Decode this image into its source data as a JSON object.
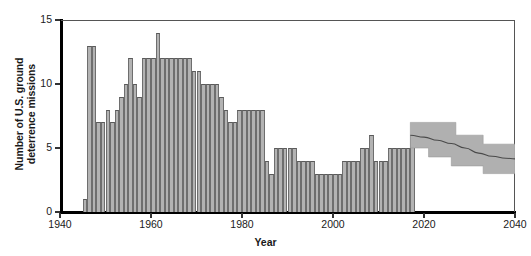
{
  "chart_data": {
    "type": "bar",
    "title": "",
    "xlabel": "Year",
    "ylabel": "Number of U.S. ground\ndeterrence missions",
    "xlim": [
      1940,
      2040
    ],
    "ylim": [
      0,
      15
    ],
    "grid": false,
    "legend": null,
    "xticks": [
      1940,
      1960,
      1980,
      2000,
      2020,
      2040
    ],
    "yticks": [
      0,
      5,
      10,
      15
    ],
    "bar_color": "#b3b3b3",
    "bar_edge_color": "#5a5a5a",
    "band_color": "#b0b0b0",
    "median_color": "#4a4a4a",
    "x": [
      1945,
      1946,
      1947,
      1948,
      1949,
      1950,
      1951,
      1952,
      1953,
      1954,
      1955,
      1956,
      1957,
      1958,
      1959,
      1960,
      1961,
      1962,
      1963,
      1964,
      1965,
      1966,
      1967,
      1968,
      1969,
      1970,
      1971,
      1972,
      1973,
      1974,
      1975,
      1976,
      1977,
      1978,
      1979,
      1980,
      1981,
      1982,
      1983,
      1984,
      1985,
      1986,
      1987,
      1988,
      1989,
      1990,
      1991,
      1992,
      1993,
      1994,
      1995,
      1996,
      1997,
      1998,
      1999,
      2000,
      2001,
      2002,
      2003,
      2004,
      2005,
      2006,
      2007,
      2008,
      2009,
      2010,
      2011,
      2012,
      2013,
      2014,
      2015,
      2016,
      2017
    ],
    "values": [
      1,
      13,
      13,
      7,
      7,
      8,
      7,
      8,
      9,
      10,
      12,
      10,
      9,
      12,
      12,
      12,
      14,
      12,
      12,
      12,
      12,
      12,
      12,
      12,
      11,
      11,
      10,
      10,
      10,
      10,
      9,
      8,
      7,
      7,
      8,
      8,
      8,
      8,
      8,
      8,
      4,
      3,
      5,
      5,
      5,
      5,
      5,
      4,
      4,
      4,
      4,
      3,
      3,
      3,
      3,
      3,
      3,
      4,
      4,
      4,
      4,
      5,
      5,
      6,
      4,
      4,
      4,
      5,
      5,
      5,
      5,
      5,
      6
    ],
    "projection": {
      "label": "projected range",
      "x_start": 2017,
      "x_end": 2040,
      "median_x": [
        2017,
        2020,
        2023,
        2026,
        2029,
        2032,
        2035,
        2038,
        2040
      ],
      "median_y": [
        6.0,
        5.85,
        5.6,
        5.35,
        5.0,
        4.6,
        4.35,
        4.2,
        4.15
      ],
      "upper_steps": [
        {
          "x0": 2017,
          "x1": 2027,
          "y": 7.0
        },
        {
          "x0": 2027,
          "x1": 2033,
          "y": 6.0
        },
        {
          "x0": 2033,
          "x1": 2040,
          "y": 5.3
        }
      ],
      "lower_steps": [
        {
          "x0": 2017,
          "x1": 2021,
          "y": 5.0
        },
        {
          "x0": 2021,
          "x1": 2026,
          "y": 4.3
        },
        {
          "x0": 2026,
          "x1": 2033,
          "y": 3.6
        },
        {
          "x0": 2033,
          "x1": 2040,
          "y": 3.0
        }
      ]
    }
  }
}
